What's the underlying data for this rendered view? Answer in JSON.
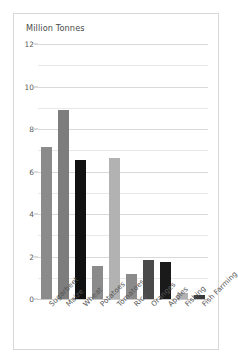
{
  "chart_data": {
    "type": "bar",
    "title": "Million Tonnes",
    "xlabel": "",
    "ylabel": "Million Tonnes",
    "ylim": [
      0,
      12
    ],
    "grid": true,
    "legend": "none",
    "yticks": [
      0,
      2,
      4,
      6,
      8,
      10,
      12
    ],
    "ytick_labels": [
      "0",
      "2",
      "4",
      "6",
      "8",
      "10",
      "12"
    ],
    "minor_gridlines": [
      1,
      3,
      5,
      7,
      9,
      11
    ],
    "categories": [
      "Sugarbeet",
      "Maize",
      "Wheat",
      "Potatoes",
      "Tomatoes",
      "Rice",
      "Oranges",
      "Apples",
      "Fishing",
      "Fish Farming"
    ],
    "values": [
      7.15,
      8.9,
      6.55,
      1.55,
      6.65,
      1.2,
      1.85,
      1.75,
      0.3,
      0.2
    ],
    "bar_colors": [
      "#8b8b8b",
      "#7d7d7d",
      "#111111",
      "#8b8b8b",
      "#b2b2b2",
      "#8b8b8b",
      "#4a4a4a",
      "#1a1a1a",
      "#b2b2b2",
      "#3a3a3a"
    ]
  },
  "style": {
    "card_background": "#ffffff",
    "card_border": "#d8d8d8",
    "gridline_color": "#d9d9d9",
    "minor_gridline_color": "#e8e8e8",
    "text_color": "#4a4a4a",
    "tick_color": "#5a5a5a"
  }
}
